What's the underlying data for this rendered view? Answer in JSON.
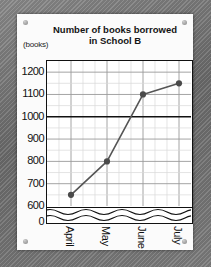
{
  "card": {
    "corner_dots": [
      "screw-top-left",
      "screw-top-right",
      "screw-bottom-left",
      "screw-bottom-right"
    ]
  },
  "chart_data": {
    "type": "line",
    "title": "Number of books borrowed in School B",
    "title_line1": "Number of books borrowed",
    "title_line2": "in School B",
    "units_label": "(books)",
    "xlabel": "",
    "ylabel": "(books)",
    "categories": [
      "April",
      "May",
      "June",
      "July"
    ],
    "values": [
      650,
      800,
      1100,
      1150
    ],
    "series": [
      {
        "name": "Books borrowed",
        "values": [
          650,
          800,
          1100,
          1150
        ]
      }
    ],
    "ytick_labels": [
      "1200",
      "1100",
      "1000",
      "900",
      "800",
      "700",
      "600",
      "0"
    ],
    "ytick_values": [
      1200,
      1100,
      1000,
      900,
      800,
      700,
      600,
      0
    ],
    "ylim": [
      600,
      1250
    ],
    "axis_break": true,
    "axis_break_between": [
      0,
      600
    ],
    "grid": true,
    "minor_grid": true,
    "emphasized_gridline": 1000,
    "legend": "none",
    "marker": "filled-circle",
    "colors": {
      "line": "#555555",
      "marker": "#4a4a4a",
      "axis": "#111111",
      "grid_major": "#9a9a9a",
      "grid_minor": "#d8d8d8",
      "card_bg": "#fbfbfb",
      "backdrop": "#7a7a7a"
    }
  }
}
